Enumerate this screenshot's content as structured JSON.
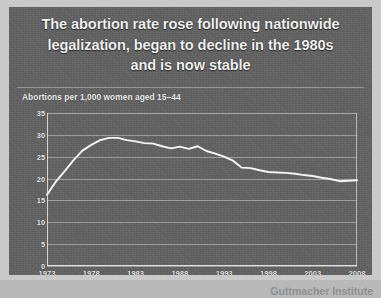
{
  "panel": {
    "background_color": "#636363",
    "frame_color": "#c9c9c9",
    "text_color": "#f2f2f2"
  },
  "title": {
    "line1": "The abortion rate rose following nationwide",
    "line2": "legalization, began to decline in the 1980s",
    "line3": "and is now stable"
  },
  "subtitle": "Abortions per 1,000 women aged 15–44",
  "attribution": "Guttmacher Institute",
  "chart_data": {
    "type": "line",
    "title": "The abortion rate rose following nationwide legalization, began to decline in the 1980s and is now stable",
    "subtitle": "Abortions per 1,000 women aged 15–44",
    "xlabel": "",
    "ylabel": "Abortions per 1,000 women aged 15–44",
    "xlim": [
      1973,
      2008
    ],
    "ylim": [
      0,
      35
    ],
    "ytick_labels": [
      "0",
      "5",
      "10",
      "15",
      "20",
      "25",
      "30",
      "35"
    ],
    "yticks": [
      0,
      5,
      10,
      15,
      20,
      25,
      30,
      35
    ],
    "xtick_labels": [
      "1973",
      "1978",
      "1983",
      "1988",
      "1993",
      "1998",
      "2003",
      "2008"
    ],
    "xticks": [
      1973,
      1978,
      1983,
      1988,
      1993,
      1998,
      2003,
      2008
    ],
    "grid": "horizontal",
    "legend": "none",
    "line_color": "#f5f5f5",
    "series": [
      {
        "name": "Abortion rate per 1,000 women aged 15–44",
        "x": [
          1973,
          1974,
          1975,
          1976,
          1977,
          1978,
          1979,
          1980,
          1981,
          1982,
          1983,
          1984,
          1985,
          1986,
          1987,
          1988,
          1989,
          1990,
          1991,
          1992,
          1993,
          1994,
          1995,
          1996,
          1997,
          1998,
          1999,
          2000,
          2001,
          2002,
          2003,
          2004,
          2005,
          2006,
          2007,
          2008
        ],
        "values": [
          16.3,
          19.3,
          21.7,
          24.2,
          26.4,
          27.7,
          28.8,
          29.3,
          29.3,
          28.8,
          28.5,
          28.1,
          28.0,
          27.4,
          26.9,
          27.3,
          26.8,
          27.4,
          26.3,
          25.7,
          25.0,
          24.1,
          22.5,
          22.4,
          21.9,
          21.5,
          21.4,
          21.3,
          21.1,
          20.8,
          20.6,
          20.2,
          19.9,
          19.4,
          19.5,
          19.6
        ]
      }
    ],
    "annotations": []
  }
}
